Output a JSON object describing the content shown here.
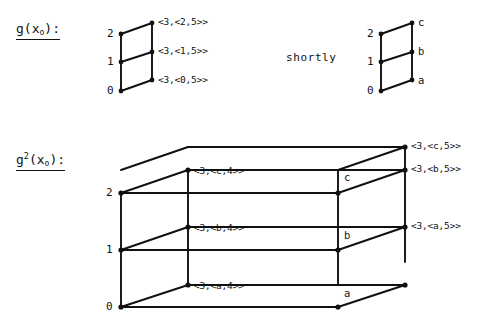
{
  "figure": {
    "background_color": "#ffffff",
    "ink_color": "#111111"
  },
  "top_row": {
    "function_label": {
      "base": "g",
      "open": "(x",
      "subscript": "o",
      "close": "):"
    },
    "left_diagram": {
      "axis_labels": [
        "2",
        "1",
        "0"
      ],
      "edge_labels": [
        "<3,<2,5>>",
        "<3,<1,5>>",
        "<3,<0,5>>"
      ]
    },
    "connector_word": "shortly",
    "right_diagram": {
      "axis_labels": [
        "2",
        "1",
        "0"
      ],
      "node_labels": [
        "c",
        "b",
        "a"
      ]
    }
  },
  "bottom_row": {
    "function_label": {
      "base": "g",
      "superscript": "2",
      "open": "(x",
      "subscript": "o",
      "close": "):"
    },
    "box_diagram": {
      "axis_labels": [
        "2",
        "1",
        "0"
      ],
      "front_labels": [
        "<3,<c,4>>",
        "<3,<b,4>>",
        "<3,<a,4>>"
      ],
      "inner_node_labels": [
        "c",
        "b",
        "a"
      ],
      "right_labels": [
        "<3,<c,5>>",
        "<3,<b,5>>",
        "<3,<a,5>>"
      ]
    }
  }
}
